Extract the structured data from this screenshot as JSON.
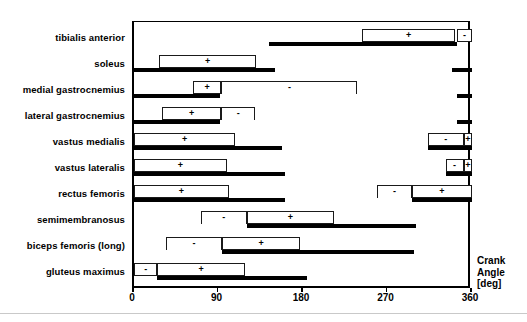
{
  "chart_data": {
    "type": "bar",
    "title": "",
    "xlabel": "Crank Angle [deg]",
    "ylabel": "",
    "xlim": [
      0,
      360
    ],
    "xticks": [
      0,
      90,
      180,
      270,
      360
    ],
    "xticklabels": [
      "0",
      "90",
      "180",
      "270",
      "360"
    ],
    "grid": false,
    "legend": "none",
    "categories": [
      "tibialis anterior",
      "soleus",
      "medial gastrocnemius",
      "lateral gastrocnemius",
      "vastus medialis",
      "vastus lateralis",
      "rectus femoris",
      "semimembranosus",
      "biceps femoris (long)",
      "gluteus maximus"
    ],
    "series": [
      {
        "name": "tibialis anterior",
        "emg_bars": [
          {
            "start": 144,
            "end": 344
          }
        ],
        "boxes": [
          {
            "start": 243,
            "end": 342,
            "sign": "+",
            "open": false
          },
          {
            "start": 344,
            "end": 360,
            "sign": "-",
            "open": false
          }
        ]
      },
      {
        "name": "soleus",
        "emg_bars": [
          {
            "start": 0,
            "end": 150
          },
          {
            "start": 339,
            "end": 360
          }
        ],
        "boxes": [
          {
            "start": 27,
            "end": 130,
            "sign": "+",
            "open": false
          }
        ]
      },
      {
        "name": "medial gastrocnemius",
        "emg_bars": [
          {
            "start": 0,
            "end": 92
          },
          {
            "start": 344,
            "end": 360
          }
        ],
        "boxes": [
          {
            "start": 63,
            "end": 93,
            "sign": "+",
            "open": false
          },
          {
            "start": 93,
            "end": 238,
            "sign": "-",
            "open": true
          }
        ]
      },
      {
        "name": "lateral gastrocnemius",
        "emg_bars": [
          {
            "start": 0,
            "end": 92
          },
          {
            "start": 344,
            "end": 360
          }
        ],
        "boxes": [
          {
            "start": 30,
            "end": 93,
            "sign": "+",
            "open": false
          },
          {
            "start": 93,
            "end": 129,
            "sign": "-",
            "open": true
          }
        ]
      },
      {
        "name": "vastus medialis",
        "emg_bars": [
          {
            "start": 0,
            "end": 158
          },
          {
            "start": 313,
            "end": 360
          }
        ],
        "boxes": [
          {
            "start": 0,
            "end": 108,
            "sign": "+",
            "open": false
          },
          {
            "start": 313,
            "end": 351,
            "sign": "-",
            "open": false
          },
          {
            "start": 351,
            "end": 360,
            "sign": "+",
            "open": false
          }
        ]
      },
      {
        "name": "vastus lateralis",
        "emg_bars": [
          {
            "start": 0,
            "end": 161
          },
          {
            "start": 332,
            "end": 360
          }
        ],
        "boxes": [
          {
            "start": 0,
            "end": 99,
            "sign": "+",
            "open": false
          },
          {
            "start": 332,
            "end": 351,
            "sign": "-",
            "open": false
          },
          {
            "start": 351,
            "end": 360,
            "sign": "+",
            "open": false
          }
        ]
      },
      {
        "name": "rectus femoris",
        "emg_bars": [
          {
            "start": 0,
            "end": 161
          },
          {
            "start": 296,
            "end": 360
          }
        ],
        "boxes": [
          {
            "start": 0,
            "end": 101,
            "sign": "+",
            "open": false
          },
          {
            "start": 259,
            "end": 296,
            "sign": "-",
            "open": true
          },
          {
            "start": 296,
            "end": 360,
            "sign": "+",
            "open": false
          }
        ]
      },
      {
        "name": "semimembranosus",
        "emg_bars": [
          {
            "start": 120,
            "end": 300
          }
        ],
        "boxes": [
          {
            "start": 71,
            "end": 120,
            "sign": "-",
            "open": true
          },
          {
            "start": 120,
            "end": 213,
            "sign": "+",
            "open": false
          }
        ]
      },
      {
        "name": "biceps femoris (long)",
        "emg_bars": [
          {
            "start": 94,
            "end": 298
          }
        ],
        "boxes": [
          {
            "start": 34,
            "end": 94,
            "sign": "-",
            "open": true
          },
          {
            "start": 94,
            "end": 177,
            "sign": "+",
            "open": false
          }
        ]
      },
      {
        "name": "gluteus maximus",
        "emg_bars": [
          {
            "start": 25,
            "end": 184
          }
        ],
        "boxes": [
          {
            "start": 0,
            "end": 25,
            "sign": "-",
            "open": false
          },
          {
            "start": 25,
            "end": 118,
            "sign": "+",
            "open": false
          }
        ]
      }
    ],
    "symbols": {
      "positive": "+",
      "negative": "-"
    }
  },
  "axis": {
    "title_line1": "Crank",
    "title_line2": "Angle",
    "title_line3": "[deg]"
  }
}
